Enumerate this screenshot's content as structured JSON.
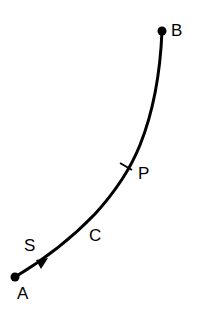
{
  "diagram": {
    "type": "path-curve",
    "background": "#ffffff",
    "stroke_color": "#000000",
    "curve": {
      "label": "C",
      "start_point": "A",
      "end_point": "B"
    },
    "points": [
      {
        "id": "A",
        "label": "A",
        "role": "start endpoint (dot)"
      },
      {
        "id": "B",
        "label": "B",
        "role": "end endpoint (dot)"
      },
      {
        "id": "P",
        "label": "P",
        "role": "intermediate point (tick mark)"
      }
    ],
    "arrow": {
      "label": "S",
      "direction": "from A toward B"
    },
    "labels": {
      "A": "A",
      "B": "B",
      "P": "P",
      "C": "C",
      "S": "S"
    }
  }
}
